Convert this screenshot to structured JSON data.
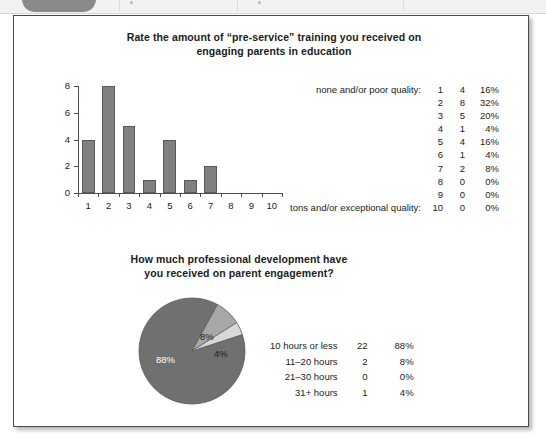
{
  "toolbar": {
    "present": true
  },
  "charts": {
    "bar": {
      "title_line1": "Rate the amount of “pre-service” training you received on",
      "title_line2": "engaging parents in education",
      "anchor_low": "none and/or poor quality:",
      "anchor_high": "tons and/or exceptional quality:"
    },
    "pie": {
      "title_line1": "How much professional development have",
      "title_line2": "you received on parent engagement?"
    }
  },
  "chart_data": [
    {
      "type": "bar",
      "title": "Rate the amount of “pre-service” training you received on engaging parents in education",
      "xlabel": "",
      "ylabel": "",
      "categories": [
        "1",
        "2",
        "3",
        "4",
        "5",
        "6",
        "7",
        "8",
        "9",
        "10"
      ],
      "values": [
        4,
        8,
        5,
        1,
        4,
        1,
        2,
        0,
        0,
        0
      ],
      "percents": [
        "16%",
        "32%",
        "20%",
        "4%",
        "16%",
        "4%",
        "8%",
        "0%",
        "0%",
        "0%"
      ],
      "ylim": [
        0,
        8
      ],
      "yticks": [
        "0",
        "2",
        "4",
        "6",
        "8"
      ],
      "grid": false,
      "legend_position": "right",
      "scale_anchor_low": "none and/or poor quality:",
      "scale_anchor_high": "tons and/or exceptional quality:",
      "bar_color": "#808080",
      "legend_rows": [
        {
          "label": "none and/or poor quality:",
          "scale": "1",
          "count": "4",
          "pct": "16%"
        },
        {
          "label": "",
          "scale": "2",
          "count": "8",
          "pct": "32%"
        },
        {
          "label": "",
          "scale": "3",
          "count": "5",
          "pct": "20%"
        },
        {
          "label": "",
          "scale": "4",
          "count": "1",
          "pct": "4%"
        },
        {
          "label": "",
          "scale": "5",
          "count": "4",
          "pct": "16%"
        },
        {
          "label": "",
          "scale": "6",
          "count": "1",
          "pct": "4%"
        },
        {
          "label": "",
          "scale": "7",
          "count": "2",
          "pct": "8%"
        },
        {
          "label": "",
          "scale": "8",
          "count": "0",
          "pct": "0%"
        },
        {
          "label": "",
          "scale": "9",
          "count": "0",
          "pct": "0%"
        },
        {
          "label": "tons and/or exceptional quality:",
          "scale": "10",
          "count": "0",
          "pct": "0%"
        }
      ]
    },
    {
      "type": "pie",
      "title": "How much professional development have you received on parent engagement?",
      "legend_position": "right",
      "slices": [
        {
          "label": "10 hours or less",
          "count": "22",
          "pct": "88%",
          "value": 88,
          "color": "#707070",
          "slice_label": "88%"
        },
        {
          "label": "11–20 hours",
          "count": "2",
          "pct": "8%",
          "value": 8,
          "color": "#a8a8a8",
          "slice_label": "8%"
        },
        {
          "label": "21–30 hours",
          "count": "0",
          "pct": "0%",
          "value": 0,
          "color": "#cfcfcf",
          "slice_label": ""
        },
        {
          "label": "31+ hours",
          "count": "1",
          "pct": "4%",
          "value": 4,
          "color": "#d8d8d8",
          "slice_label": "4%"
        }
      ]
    }
  ]
}
